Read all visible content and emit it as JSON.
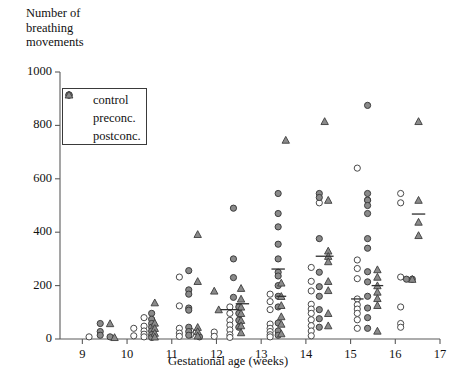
{
  "chart_data": {
    "type": "scatter",
    "title": "",
    "ylabel": "Number of\nbreathing\nmovements",
    "xlabel": "Gestational age (weeks)",
    "xlim": [
      8.5,
      17.0
    ],
    "ylim": [
      0,
      1000
    ],
    "xticks": [
      9,
      10,
      11,
      12,
      13,
      14,
      15,
      16,
      17
    ],
    "yticks": [
      0,
      200,
      400,
      600,
      800,
      1000
    ],
    "xtick_labels": [
      "9",
      "10",
      "11",
      "12",
      "13",
      "14",
      "15",
      "16",
      "17"
    ],
    "ytick_labels": [
      "0",
      "200",
      "400",
      "600",
      "800",
      "1000"
    ],
    "grid": false,
    "legend_position": "upper-left-inside",
    "legend": [
      {
        "label": "control",
        "marker": "open-circle",
        "color": "#ffffff"
      },
      {
        "label": "preconc.",
        "marker": "filled-circle",
        "color": "#8a8a8a"
      },
      {
        "label": "postconc.",
        "marker": "filled-triangle",
        "color": "#8a8a8a"
      }
    ],
    "series": [
      {
        "name": "control",
        "marker": "open-circle",
        "points": [
          [
            9.15,
            8
          ],
          [
            10.15,
            40
          ],
          [
            10.15,
            12
          ],
          [
            10.38,
            80
          ],
          [
            10.38,
            48
          ],
          [
            10.38,
            30
          ],
          [
            10.38,
            18
          ],
          [
            10.38,
            8
          ],
          [
            11.17,
            232
          ],
          [
            11.17,
            124
          ],
          [
            11.17,
            40
          ],
          [
            11.17,
            22
          ],
          [
            11.17,
            10
          ],
          [
            11.42,
            30
          ],
          [
            11.42,
            16
          ],
          [
            11.95,
            26
          ],
          [
            11.95,
            10
          ],
          [
            12.3,
            120
          ],
          [
            12.3,
            96
          ],
          [
            12.3,
            70
          ],
          [
            12.3,
            52
          ],
          [
            12.3,
            34
          ],
          [
            12.3,
            16
          ],
          [
            12.3,
            6
          ],
          [
            13.2,
            168
          ],
          [
            13.2,
            140
          ],
          [
            13.2,
            110
          ],
          [
            13.2,
            56
          ],
          [
            13.2,
            40
          ],
          [
            13.2,
            28
          ],
          [
            13.2,
            16
          ],
          [
            13.2,
            8
          ],
          [
            14.12,
            268
          ],
          [
            14.12,
            216
          ],
          [
            14.12,
            180
          ],
          [
            14.12,
            130
          ],
          [
            14.12,
            112
          ],
          [
            14.12,
            96
          ],
          [
            14.12,
            72
          ],
          [
            14.12,
            50
          ],
          [
            14.12,
            30
          ],
          [
            14.12,
            12
          ],
          [
            14.3,
            510
          ],
          [
            15.15,
            640
          ],
          [
            15.15,
            296
          ],
          [
            15.15,
            264
          ],
          [
            15.15,
            226
          ],
          [
            15.15,
            150
          ],
          [
            15.15,
            128
          ],
          [
            15.15,
            112
          ],
          [
            15.15,
            96
          ],
          [
            15.15,
            72
          ],
          [
            15.15,
            40
          ],
          [
            15.38,
            520
          ],
          [
            16.12,
            545
          ],
          [
            16.12,
            510
          ],
          [
            16.12,
            232
          ],
          [
            16.12,
            120
          ],
          [
            16.12,
            58
          ],
          [
            16.12,
            44
          ]
        ]
      },
      {
        "name": "preconc.",
        "marker": "filled-circle",
        "points": [
          [
            9.4,
            58
          ],
          [
            9.4,
            28
          ],
          [
            9.4,
            14
          ],
          [
            9.62,
            8
          ],
          [
            10.55,
            96
          ],
          [
            10.55,
            74
          ],
          [
            10.55,
            58
          ],
          [
            10.55,
            44
          ],
          [
            10.55,
            30
          ],
          [
            10.55,
            16
          ],
          [
            10.55,
            6
          ],
          [
            11.38,
            256
          ],
          [
            11.38,
            184
          ],
          [
            11.38,
            168
          ],
          [
            11.38,
            116
          ],
          [
            11.38,
            108
          ],
          [
            11.38,
            44
          ],
          [
            11.38,
            28
          ],
          [
            11.38,
            14
          ],
          [
            11.62,
            8
          ],
          [
            12.38,
            490
          ],
          [
            12.38,
            300
          ],
          [
            12.38,
            230
          ],
          [
            12.38,
            156
          ],
          [
            12.5,
            120
          ],
          [
            12.5,
            96
          ],
          [
            12.5,
            70
          ],
          [
            12.5,
            44
          ],
          [
            13.38,
            545
          ],
          [
            13.38,
            470
          ],
          [
            13.38,
            420
          ],
          [
            13.38,
            355
          ],
          [
            13.38,
            300
          ],
          [
            13.38,
            250
          ],
          [
            13.38,
            236
          ],
          [
            13.38,
            200
          ],
          [
            13.38,
            160
          ],
          [
            13.38,
            120
          ],
          [
            13.38,
            60
          ],
          [
            13.38,
            30
          ],
          [
            13.38,
            14
          ],
          [
            14.3,
            545
          ],
          [
            14.3,
            530
          ],
          [
            14.3,
            376
          ],
          [
            14.3,
            250
          ],
          [
            14.3,
            196
          ],
          [
            14.3,
            160
          ],
          [
            14.3,
            110
          ],
          [
            14.3,
            76
          ],
          [
            14.3,
            44
          ],
          [
            15.38,
            875
          ],
          [
            15.38,
            545
          ],
          [
            15.38,
            520
          ],
          [
            15.38,
            500
          ],
          [
            15.38,
            470
          ],
          [
            15.38,
            376
          ],
          [
            15.38,
            340
          ],
          [
            15.38,
            252
          ],
          [
            15.38,
            214
          ],
          [
            15.38,
            160
          ],
          [
            15.38,
            116
          ],
          [
            15.38,
            80
          ],
          [
            15.38,
            40
          ],
          [
            16.25,
            224
          ],
          [
            16.38,
            224
          ]
        ]
      },
      {
        "name": "postconc.",
        "marker": "filled-triangle",
        "points": [
          [
            9.62,
            58
          ],
          [
            9.72,
            6
          ],
          [
            10.62,
            136
          ],
          [
            10.62,
            60
          ],
          [
            10.62,
            40
          ],
          [
            10.62,
            22
          ],
          [
            10.62,
            8
          ],
          [
            11.58,
            392
          ],
          [
            11.58,
            216
          ],
          [
            11.58,
            44
          ],
          [
            11.58,
            28
          ],
          [
            11.58,
            12
          ],
          [
            11.95,
            180
          ],
          [
            12.05,
            110
          ],
          [
            12.55,
            190
          ],
          [
            12.55,
            150
          ],
          [
            12.55,
            120
          ],
          [
            12.55,
            96
          ],
          [
            12.55,
            70
          ],
          [
            12.55,
            50
          ],
          [
            12.55,
            24
          ],
          [
            13.45,
            210
          ],
          [
            13.45,
            160
          ],
          [
            13.45,
            126
          ],
          [
            13.45,
            84
          ],
          [
            13.45,
            56
          ],
          [
            13.45,
            20
          ],
          [
            13.55,
            745
          ],
          [
            14.42,
            815
          ],
          [
            14.5,
            520
          ],
          [
            14.5,
            330
          ],
          [
            14.5,
            310
          ],
          [
            14.5,
            290
          ],
          [
            14.5,
            216
          ],
          [
            14.5,
            182
          ],
          [
            14.5,
            96
          ],
          [
            14.5,
            50
          ],
          [
            15.6,
            260
          ],
          [
            15.6,
            232
          ],
          [
            15.6,
            200
          ],
          [
            15.6,
            176
          ],
          [
            15.6,
            152
          ],
          [
            15.6,
            126
          ],
          [
            15.6,
            30
          ],
          [
            16.38,
            224
          ],
          [
            16.52,
            815
          ],
          [
            16.52,
            520
          ],
          [
            16.52,
            438
          ],
          [
            16.52,
            388
          ]
        ]
      }
    ],
    "mean_markers": [
      {
        "x": 12.3,
        "y": 110,
        "width": 0.42
      },
      {
        "x": 12.58,
        "y": 132,
        "width": 0.3
      },
      {
        "x": 13.38,
        "y": 262,
        "width": 0.3
      },
      {
        "x": 13.45,
        "y": 160,
        "width": 0.22
      },
      {
        "x": 14.42,
        "y": 310,
        "width": 0.4
      },
      {
        "x": 15.15,
        "y": 150,
        "width": 0.28
      },
      {
        "x": 15.6,
        "y": 200,
        "width": 0.26
      },
      {
        "x": 16.52,
        "y": 468,
        "width": 0.3
      }
    ]
  }
}
